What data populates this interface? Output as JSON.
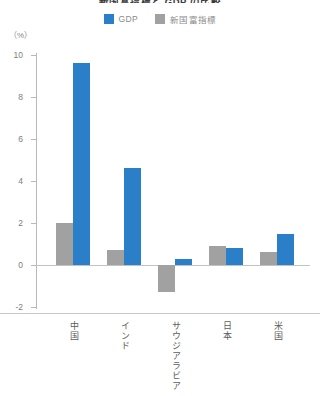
{
  "title": "新国富指標と GDP の比較",
  "axis_unit": "（%）",
  "legend": [
    {
      "label": "GDP",
      "color": "#2b7fc8",
      "key": "gdp"
    },
    {
      "label": "新国富指標",
      "color": "#a1a1a1",
      "key": "iwi"
    }
  ],
  "colors": {
    "gdp": "#2b7fc8",
    "iwi": "#a1a1a1",
    "axis": "#b9b9b9",
    "text": "#7d7d7d"
  },
  "chart_data": {
    "type": "bar",
    "title": "新国富指標と GDP の比較",
    "xlabel": "",
    "ylabel": "（%）",
    "ylim": [
      -2,
      10
    ],
    "yticks": [
      -2,
      0,
      2,
      4,
      6,
      8,
      10
    ],
    "ytick_labels": [
      "-2",
      "0",
      "2",
      "4",
      "6",
      "8",
      "10"
    ],
    "grid": false,
    "legend_position": "top-center",
    "categories": [
      "中国",
      "インド",
      "サウジアラビア",
      "日本",
      "米国"
    ],
    "series": [
      {
        "name": "新国富指標",
        "color": "#a1a1a1",
        "values": [
          2.0,
          0.7,
          -1.3,
          0.9,
          0.6
        ]
      },
      {
        "name": "GDP",
        "color": "#2b7fc8",
        "values": [
          9.6,
          4.6,
          0.3,
          0.8,
          1.5
        ]
      }
    ]
  }
}
